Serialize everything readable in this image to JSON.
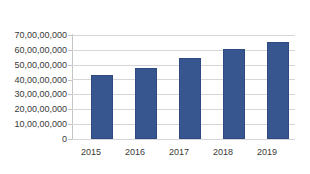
{
  "chart_data": {
    "type": "bar",
    "title": "",
    "subtitle": "",
    "xlabel": "",
    "ylabel": "",
    "categories": [
      "2015",
      "2016",
      "2017",
      "2018",
      "2019"
    ],
    "values": [
      430000000,
      480000000,
      545000000,
      605000000,
      650000000
    ],
    "value_labels": [
      "43,00,00,000",
      "48,00,00,000",
      "54,50,00,000",
      "60,50,00,000",
      "65,00,00,000"
    ],
    "ylim": [
      0,
      700000000
    ],
    "ytick_values": [
      0,
      100000000,
      200000000,
      300000000,
      400000000,
      500000000,
      600000000,
      700000000
    ],
    "ytick_labels": [
      "0",
      "10,00,00,000",
      "20,00,00,000",
      "30,00,00,000",
      "40,00,00,000",
      "50,00,00,000",
      "60,00,00,000",
      "70,00,00,000"
    ],
    "legend": [],
    "legend_position": "none",
    "grid": true,
    "grid_axis": "y",
    "series": [
      {
        "name": "",
        "values": [
          430000000,
          480000000,
          545000000,
          605000000,
          650000000
        ]
      }
    ],
    "colors": {
      "bar": "#37558f",
      "bar_border": "#2f4a80",
      "gridline": "#d6d6d6",
      "axis": "#c4c4c4",
      "text": "#3a3a3a",
      "background": "#ffffff"
    }
  }
}
